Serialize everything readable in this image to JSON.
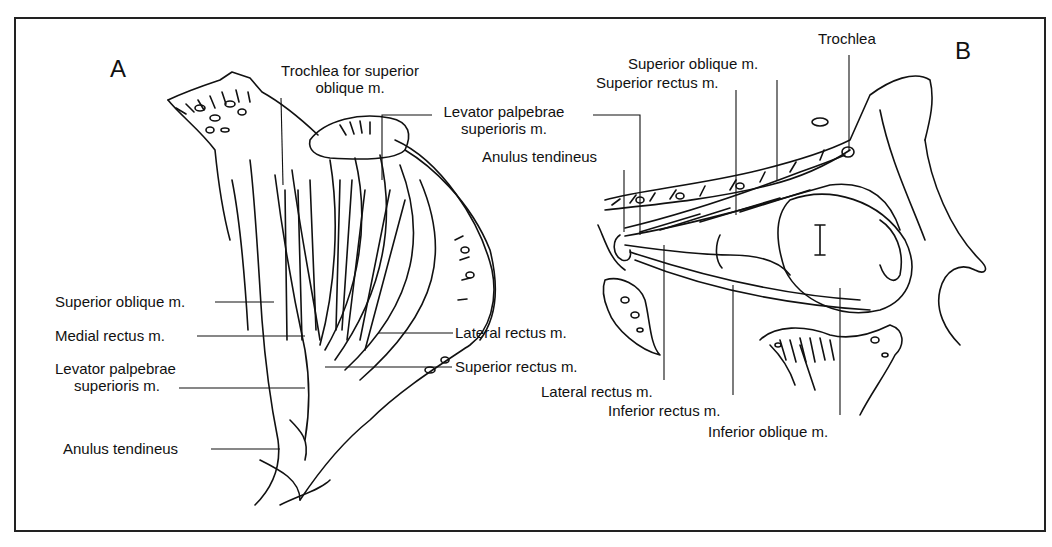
{
  "figure": {
    "panels": [
      {
        "id": "A",
        "letter": "A"
      },
      {
        "id": "B",
        "letter": "B"
      }
    ],
    "panel_a": {
      "labels": {
        "trochlea_l1": "Trochlea for superior",
        "trochlea_l2": "oblique m.",
        "levator_l1": "Levator palpebrae",
        "levator_l2": "superioris m.",
        "superior_oblique": "Superior oblique m.",
        "medial_rectus": "Medial rectus m.",
        "levator2_l1": "Levator palpebrae",
        "levator2_l2": "superioris m.",
        "anulus": "Anulus tendineus",
        "lateral_rectus": "Lateral rectus m.",
        "superior_rectus": "Superior rectus m."
      }
    },
    "panel_b": {
      "labels": {
        "trochlea": "Trochlea",
        "superior_oblique": "Superior oblique m.",
        "superior_rectus": "Superior rectus m.",
        "anulus": "Anulus tendineus",
        "lateral_rectus": "Lateral rectus m.",
        "inferior_rectus": "Inferior rectus m.",
        "inferior_oblique": "Inferior oblique m."
      }
    }
  }
}
